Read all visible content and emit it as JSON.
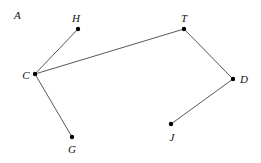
{
  "diagram": {
    "region_label": "A",
    "vertices": [
      {
        "id": "H",
        "label": "H",
        "x": 78,
        "y": 29,
        "lx": 76,
        "ly": 22,
        "anchor": "middle"
      },
      {
        "id": "T",
        "label": "T",
        "x": 184,
        "y": 29,
        "lx": 184,
        "ly": 22,
        "anchor": "middle"
      },
      {
        "id": "C",
        "label": "C",
        "x": 35,
        "y": 74,
        "lx": 26,
        "ly": 79,
        "anchor": "middle"
      },
      {
        "id": "D",
        "label": "D",
        "x": 233,
        "y": 79,
        "lx": 244,
        "ly": 83,
        "anchor": "middle"
      },
      {
        "id": "G",
        "label": "G",
        "x": 72,
        "y": 137,
        "lx": 72,
        "ly": 153,
        "anchor": "middle"
      },
      {
        "id": "J",
        "label": "J",
        "x": 171,
        "y": 124,
        "lx": 172,
        "ly": 141,
        "anchor": "middle"
      }
    ],
    "edges": [
      [
        "C",
        "H"
      ],
      [
        "C",
        "T"
      ],
      [
        "C",
        "G"
      ],
      [
        "T",
        "D"
      ],
      [
        "D",
        "J"
      ]
    ],
    "colors": {
      "edge": "#444444",
      "point": "#000000",
      "text": "#111111",
      "background": "#ffffff"
    }
  }
}
